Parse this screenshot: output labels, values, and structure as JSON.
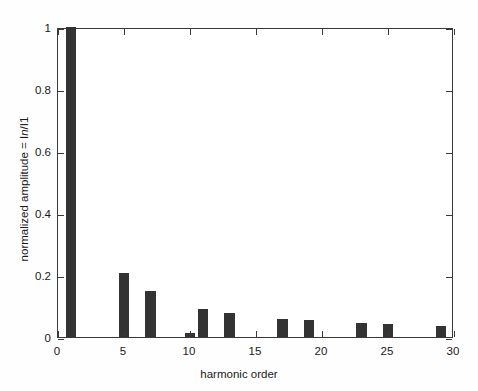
{
  "figure": {
    "background_color": "#ffffff",
    "axis_color": "#3a3a3a",
    "bar_color": "#333333"
  },
  "axes": {
    "xlabel": "harmonic order",
    "ylabel_prefix": "normalized amplitude = I",
    "ylabel_italic": "n",
    "ylabel_suffix": "/I1",
    "ylabel_full": "normalized amplitude = In/I1",
    "xticklabels": [
      "0",
      "5",
      "10",
      "15",
      "20",
      "25",
      "30"
    ],
    "yticklabels": [
      "0",
      "0.2",
      "0.4",
      "0.6",
      "0.8",
      "1"
    ]
  },
  "chart_data": {
    "type": "bar",
    "title": "",
    "xlabel": "harmonic order",
    "ylabel": "normalized amplitude = In/I1",
    "xlim": [
      0,
      30
    ],
    "ylim": [
      0,
      1
    ],
    "xticks": [
      0,
      5,
      10,
      15,
      20,
      25,
      30
    ],
    "yticks": [
      0,
      0.2,
      0.4,
      0.6,
      0.8,
      1
    ],
    "grid": false,
    "legend": null,
    "bar_color": "#333333",
    "bar_width": 0.8,
    "categories": [
      1,
      5,
      7,
      10,
      11,
      13,
      17,
      19,
      23,
      25,
      29
    ],
    "values": [
      1.0,
      0.205,
      0.147,
      0.012,
      0.089,
      0.079,
      0.058,
      0.054,
      0.046,
      0.043,
      0.037
    ],
    "series": [
      {
        "name": "normalized harmonic amplitude",
        "points": [
          {
            "x": 1,
            "y": 1.0
          },
          {
            "x": 5,
            "y": 0.205
          },
          {
            "x": 7,
            "y": 0.147
          },
          {
            "x": 10,
            "y": 0.012
          },
          {
            "x": 11,
            "y": 0.089
          },
          {
            "x": 13,
            "y": 0.079
          },
          {
            "x": 17,
            "y": 0.058
          },
          {
            "x": 19,
            "y": 0.054
          },
          {
            "x": 23,
            "y": 0.046
          },
          {
            "x": 25,
            "y": 0.043
          },
          {
            "x": 29,
            "y": 0.037
          }
        ]
      }
    ]
  }
}
